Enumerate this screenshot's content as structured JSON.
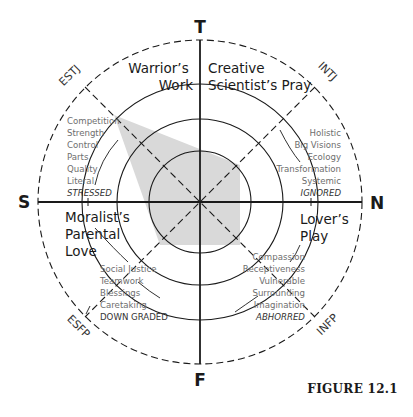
{
  "figure": {
    "caption": "FIGURE 12.1",
    "colors": {
      "line": "#1a1a1a",
      "shade": "#d9d9d9",
      "trait_text": "#6e6e6e"
    },
    "axes": {
      "top": "T",
      "bottom": "F",
      "left": "S",
      "right": "N"
    },
    "types": {
      "upper_left": "ESTJ",
      "upper_right": "INTJ",
      "lower_left": "ESFP",
      "lower_right": "INFP"
    },
    "quadrants": {
      "upper_left": {
        "title_lines": [
          "Warrior’s",
          "Work"
        ],
        "traits": [
          "Competition",
          "Strength",
          "Control",
          "Parts",
          "Quality",
          "Literal"
        ],
        "state": "STRESSED"
      },
      "upper_right": {
        "title_lines": [
          "Creative",
          "Scientist’s Pray"
        ],
        "traits": [
          "Holistic",
          "Big Visions",
          "Ecology",
          "Transformation",
          "Systemic"
        ],
        "state": "IGNORED"
      },
      "lower_left": {
        "title_lines": [
          "Moralist’s",
          "Parental",
          "Love"
        ],
        "traits": [
          "Social Justice",
          "Teamwork",
          "Blessings",
          "Caretaking"
        ],
        "state": "DOWN GRADED"
      },
      "lower_right": {
        "title_lines": [
          "Lover’s",
          "Play"
        ],
        "traits": [
          "Compassion",
          "Receptiveness",
          "Vulnerable",
          "Surrounding",
          "Imagination"
        ],
        "state": "ABHORRED"
      }
    }
  }
}
